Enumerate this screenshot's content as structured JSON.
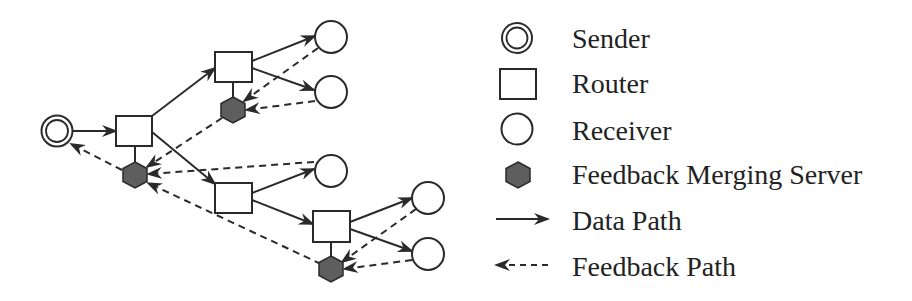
{
  "colors": {
    "stroke": "#2a2a2a",
    "hexagon_fill": "#5e5e5e",
    "background": "#ffffff"
  },
  "legend": {
    "items": [
      {
        "icon": "sender-icon",
        "label": "Sender"
      },
      {
        "icon": "router-icon",
        "label": "Router"
      },
      {
        "icon": "receiver-icon",
        "label": "Receiver"
      },
      {
        "icon": "feedback-merging-server-icon",
        "label": "Feedback Merging Server"
      },
      {
        "icon": "data-path-arrow-icon",
        "label": "Data Path"
      },
      {
        "icon": "feedback-path-arrow-icon",
        "label": "Feedback Path"
      }
    ]
  },
  "topology": {
    "nodes": [
      {
        "id": "S",
        "type": "sender"
      },
      {
        "id": "R1",
        "type": "router"
      },
      {
        "id": "R2",
        "type": "router"
      },
      {
        "id": "R3",
        "type": "router"
      },
      {
        "id": "R4",
        "type": "router"
      },
      {
        "id": "F1",
        "type": "feedback-merging-server",
        "attached_to": "R1"
      },
      {
        "id": "F2",
        "type": "feedback-merging-server",
        "attached_to": "R2"
      },
      {
        "id": "F4",
        "type": "feedback-merging-server",
        "attached_to": "R4"
      },
      {
        "id": "C1",
        "type": "receiver"
      },
      {
        "id": "C2",
        "type": "receiver"
      },
      {
        "id": "C3",
        "type": "receiver"
      },
      {
        "id": "C4",
        "type": "receiver"
      },
      {
        "id": "C5",
        "type": "receiver"
      }
    ],
    "data_paths": [
      [
        "S",
        "R1"
      ],
      [
        "R1",
        "R2"
      ],
      [
        "R1",
        "R3"
      ],
      [
        "R2",
        "C1"
      ],
      [
        "R2",
        "C2"
      ],
      [
        "R3",
        "C3"
      ],
      [
        "R3",
        "R4"
      ],
      [
        "R4",
        "C4"
      ],
      [
        "R4",
        "C5"
      ]
    ],
    "feedback_paths": [
      [
        "C1",
        "F2"
      ],
      [
        "C2",
        "F2"
      ],
      [
        "F2",
        "F1"
      ],
      [
        "C3",
        "F1"
      ],
      [
        "C4",
        "F4"
      ],
      [
        "C5",
        "F4"
      ],
      [
        "F4",
        "F1"
      ],
      [
        "F1",
        "S"
      ]
    ]
  }
}
